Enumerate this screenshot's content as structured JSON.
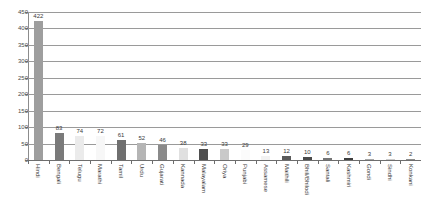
{
  "title_strip": "",
  "chart_data": {
    "type": "bar",
    "title": "",
    "subtitle": "",
    "xlabel": "",
    "ylabel": "",
    "ylim": [
      0,
      450
    ],
    "yticks": [
      0,
      50,
      100,
      150,
      200,
      250,
      300,
      350,
      400,
      450
    ],
    "grid": true,
    "legend": false,
    "categories": [
      "Hindi",
      "Bengali",
      "Telugu",
      "Marathi",
      "Tamil",
      "Urdu",
      "Gujarati",
      "Kannada",
      "Malayalam",
      "Oriya",
      "Punjabi",
      "Assamese",
      "Maithili",
      "Bhili/Bhilodi",
      "Santali",
      "Kashmiri",
      "Gondi",
      "Sindhi",
      "Konkani"
    ],
    "values": [
      422,
      83,
      74,
      72,
      61,
      52,
      46,
      38,
      33,
      33,
      29,
      13,
      12,
      10,
      6,
      6,
      3,
      3,
      2
    ],
    "bar_colors": [
      "#9e9e9e",
      "#7a7a7a",
      "#ebebeb",
      "#f7f7f7",
      "#6f6f6f",
      "#b5b5b5",
      "#8a8a8a",
      "#e0e0e0",
      "#4f4f4f",
      "#c9c9c9",
      "#fbfbfb",
      "#f2f2f2",
      "#5a5a5a",
      "#4a4a4a",
      "#767676",
      "#3f3f3f",
      "#a8a8a8",
      "#cccccc",
      "#8f8f8f"
    ]
  },
  "colors": {
    "gridline": "#9a9a9a",
    "axis": "#6e6e6e",
    "text": "#3a3a3a",
    "background": "#ffffff"
  }
}
